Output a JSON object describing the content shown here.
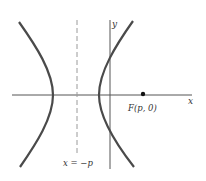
{
  "figure": {
    "type": "hyperbola-diagram",
    "labels": {
      "x_axis": "x",
      "y_axis": "y",
      "focus": "F(p, 0)",
      "directrix": "x = −p"
    },
    "colors": {
      "curve": "#4a4a4a",
      "axis": "#555555",
      "dashed": "#9a9a9a",
      "point": "#111111",
      "text": "#333333"
    }
  }
}
